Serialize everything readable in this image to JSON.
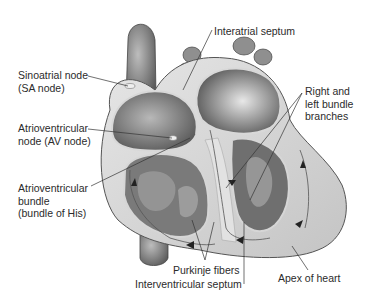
{
  "diagram": {
    "labels": {
      "sa_node": {
        "line1": "Sinoatrial node",
        "line2": "(SA node)"
      },
      "av_node": {
        "line1": "Atrioventricular",
        "line2": "node (AV node)"
      },
      "av_bundle": {
        "line1": "Atrioventricular",
        "line2": "bundle",
        "line3": "(bundle of His)"
      },
      "interatrial_septum": {
        "line1": "Interatrial septum"
      },
      "bundle_branches": {
        "line1": "Right and",
        "line2": "left bundle",
        "line3": "branches"
      },
      "purkinje": {
        "line1": "Purkinje fibers"
      },
      "interventricular_septum": {
        "line1": "Interventricular septum"
      },
      "apex": {
        "line1": "Apex of heart"
      }
    },
    "colors": {
      "background": "#ffffff",
      "text": "#2b2b2b",
      "leader": "#333333",
      "tissue_dark": "#6e6e6e",
      "tissue_mid": "#9a9a9a",
      "tissue_light": "#d9d9d9",
      "wall": "#c8c8c8"
    }
  }
}
